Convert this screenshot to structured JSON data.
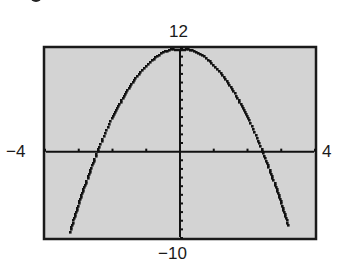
{
  "window_labels": {
    "ymax": "12",
    "ymin": "−10",
    "xmin": "−4",
    "xmax": "4"
  },
  "colors": {
    "screen_bg": "#d3d3d3",
    "ink": "#111111",
    "frame": "#1a1a1a"
  },
  "chart_data": {
    "type": "line",
    "title": "",
    "function": "y = -2x^2 + 12",
    "xlabel": "",
    "ylabel": "",
    "xlim": [
      -4,
      4
    ],
    "ylim": [
      -10,
      12
    ],
    "xscale_ticks": 1,
    "yscale_ticks": 1,
    "grid": false,
    "legend": null,
    "window_labels": {
      "xmin": "-4",
      "xmax": "4",
      "ymin": "-10",
      "ymax": "12"
    },
    "series": [
      {
        "name": "parabola",
        "style": "dotted-pixel",
        "x": [
          -3.26,
          -3.0,
          -2.5,
          -2.45,
          -2.0,
          -1.5,
          -1.0,
          -0.5,
          0.0,
          0.5,
          1.0,
          1.5,
          2.0,
          2.45,
          2.5,
          3.0,
          3.2
        ],
        "y": [
          -9.26,
          -6.0,
          -0.5,
          0.0,
          4.0,
          7.5,
          10.0,
          11.5,
          12.0,
          11.5,
          10.0,
          7.5,
          4.0,
          0.0,
          -0.5,
          -6.0,
          -8.48
        ]
      }
    ],
    "key_points": {
      "vertex": [
        0,
        12
      ],
      "x_intercepts": [
        -2.45,
        2.45
      ]
    }
  }
}
